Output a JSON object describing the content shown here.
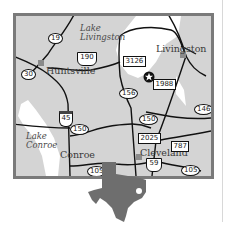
{
  "map": {
    "region": "Southeast Texas",
    "colors": {
      "land": "#d4d4d4",
      "water": "#ffffff",
      "frame": "#7a7a7a",
      "roads": "#111111",
      "texas_silhouette": "#6e6e6e"
    },
    "cities": [
      {
        "name": "Huntsville"
      },
      {
        "name": "Livingston"
      },
      {
        "name": "Conroe"
      },
      {
        "name": "Cleveland"
      }
    ],
    "lakes": [
      {
        "name_line1": "Lake",
        "name_line2": "Livingston"
      },
      {
        "name_line1": "Lake",
        "name_line2": "Conroe"
      }
    ],
    "highways": {
      "state": [
        "19",
        "30",
        "150",
        "156",
        "150",
        "146",
        "105",
        "105"
      ],
      "us": [
        "190",
        "59"
      ],
      "interstate": [
        "45"
      ],
      "farm_to_market": [
        "3126",
        "1988",
        "2025",
        "787"
      ]
    },
    "marker": {
      "type": "star",
      "label": ""
    }
  }
}
